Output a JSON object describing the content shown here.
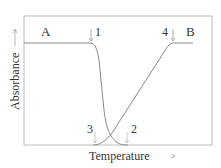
{
  "diagram": {
    "xlabel": "Temperature",
    "ylabel": "Absorbance",
    "state_labels": {
      "left": "A",
      "right": "B"
    },
    "markers": [
      {
        "id": "1",
        "label": "1",
        "position": "top",
        "x": 92
      },
      {
        "id": "2",
        "label": "2",
        "position": "bottom",
        "x": 127
      },
      {
        "id": "3",
        "label": "3",
        "position": "bottom",
        "x": 95
      },
      {
        "id": "4",
        "label": "4",
        "position": "top",
        "x": 173
      }
    ],
    "curves": [
      {
        "name": "A-to-low",
        "description": "High plateau from A, sharp decline between markers 1 and 2"
      },
      {
        "name": "low-to-B",
        "description": "Rise from marker 3 to plateau B at marker 4"
      }
    ],
    "colors": {
      "line": "#888888",
      "frame": "#999999",
      "text": "#333333"
    }
  }
}
